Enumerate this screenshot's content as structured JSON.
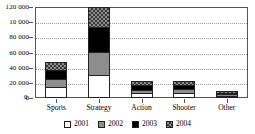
{
  "chart_data": {
    "type": "bar",
    "subtype": "stacked-vertical-bar",
    "title": "",
    "xlabel": "",
    "ylabel": "",
    "ylim": [
      0,
      120000
    ],
    "grid": true,
    "legend_position": "bottom",
    "categories": [
      "Sports",
      "Strategy",
      "Action",
      "Shooter",
      "Other"
    ],
    "y_ticks": [
      {
        "value": 120000,
        "label": "120 000"
      },
      {
        "value": 100000,
        "label": "10 000"
      },
      {
        "value": 80000,
        "label": "80 000"
      },
      {
        "value": 60000,
        "label": "60 000"
      },
      {
        "value": 40000,
        "label": "40 000"
      },
      {
        "value": 20000,
        "label": "20 000"
      },
      {
        "value": 0,
        "label": "0"
      }
    ],
    "series": [
      {
        "name": "2001",
        "color": "#ffffff",
        "pattern": "solid",
        "values": [
          14000,
          31000,
          6000,
          7000,
          1000
        ]
      },
      {
        "name": "2002",
        "color": "#8d8d8d",
        "pattern": "solid",
        "values": [
          11000,
          30000,
          5000,
          5000,
          2000
        ]
      },
      {
        "name": "2003",
        "color": "#000000",
        "pattern": "solid",
        "values": [
          12000,
          32000,
          6000,
          5000,
          2000
        ]
      },
      {
        "name": "2004",
        "color": "#8a8a8a",
        "pattern": "checker",
        "values": [
          11000,
          27000,
          6000,
          5000,
          2000
        ]
      }
    ],
    "totals": [
      48000,
      120000,
      23000,
      22000,
      7000
    ]
  },
  "legend": {
    "items": [
      {
        "label": "2001"
      },
      {
        "label": "2002"
      },
      {
        "label": "2003"
      },
      {
        "label": "2004"
      }
    ]
  }
}
